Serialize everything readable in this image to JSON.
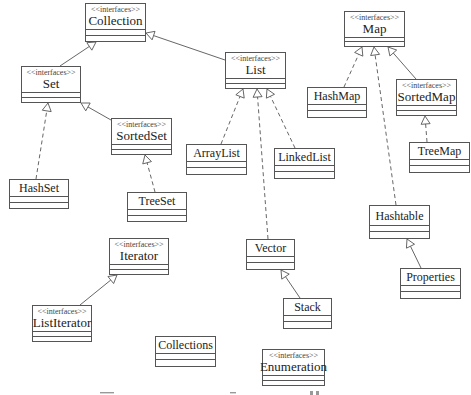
{
  "diagram": {
    "type": "UML class diagram",
    "stereotype_label": "<<interfaces>>",
    "nodes": {
      "collection": {
        "name": "Collection",
        "interface": true
      },
      "set": {
        "name": "Set",
        "interface": true
      },
      "list": {
        "name": "List",
        "interface": true
      },
      "sortedset": {
        "name": "SortedSet",
        "interface": true
      },
      "hashset": {
        "name": "HashSet",
        "interface": false
      },
      "treeset": {
        "name": "TreeSet",
        "interface": false
      },
      "arraylist": {
        "name": "ArrayList",
        "interface": false
      },
      "linkedlist": {
        "name": "LinkedList",
        "interface": false
      },
      "vector": {
        "name": "Vector",
        "interface": false
      },
      "stack": {
        "name": "Stack",
        "interface": false
      },
      "map": {
        "name": "Map",
        "interface": true
      },
      "hashmap": {
        "name": "HashMap",
        "interface": false
      },
      "sortedmap": {
        "name": "SortedMap",
        "interface": true
      },
      "treemap": {
        "name": "TreeMap",
        "interface": false
      },
      "hashtable": {
        "name": "Hashtable",
        "interface": false
      },
      "properties": {
        "name": "Properties",
        "interface": false
      },
      "iterator": {
        "name": "Iterator",
        "interface": true
      },
      "listiterator": {
        "name": "ListIterator",
        "interface": true
      },
      "collections": {
        "name": "Collections",
        "interface": false
      },
      "enumeration": {
        "name": "Enumeration",
        "interface": true
      }
    },
    "edges": [
      {
        "from": "set",
        "to": "collection",
        "kind": "extends"
      },
      {
        "from": "list",
        "to": "collection",
        "kind": "extends"
      },
      {
        "from": "sortedset",
        "to": "set",
        "kind": "extends"
      },
      {
        "from": "hashset",
        "to": "set",
        "kind": "implements"
      },
      {
        "from": "treeset",
        "to": "sortedset",
        "kind": "implements"
      },
      {
        "from": "arraylist",
        "to": "list",
        "kind": "implements"
      },
      {
        "from": "vector",
        "to": "list",
        "kind": "implements"
      },
      {
        "from": "linkedlist",
        "to": "list",
        "kind": "implements"
      },
      {
        "from": "stack",
        "to": "vector",
        "kind": "extends"
      },
      {
        "from": "hashmap",
        "to": "map",
        "kind": "implements"
      },
      {
        "from": "hashtable",
        "to": "map",
        "kind": "implements"
      },
      {
        "from": "sortedmap",
        "to": "map",
        "kind": "extends"
      },
      {
        "from": "treemap",
        "to": "sortedmap",
        "kind": "implements"
      },
      {
        "from": "properties",
        "to": "hashtable",
        "kind": "extends"
      },
      {
        "from": "listiterator",
        "to": "iterator",
        "kind": "extends"
      }
    ],
    "caption_visible": "cut off (unreadable)"
  }
}
